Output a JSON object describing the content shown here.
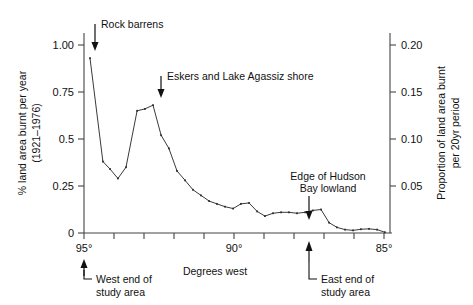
{
  "chart_data": {
    "type": "line",
    "title": "",
    "xlabel": "Degrees west",
    "ylabel": "% land area burnt per year (1921–1976)",
    "y2label": "Proportion of land area burnt per 20yr period",
    "xlim": [
      95,
      84.8
    ],
    "ylim": [
      0,
      1.05
    ],
    "y2lim": [
      0,
      0.21
    ],
    "grid": false,
    "legend": "none",
    "x_axis_direction": "decreasing degrees west (left to right)",
    "xticks": [
      95,
      90,
      85
    ],
    "xticklabels": [
      "95°",
      "90°",
      "85°"
    ],
    "xminorticks": [
      94,
      93,
      92,
      91,
      89,
      88,
      87,
      86
    ],
    "yticks": [
      0,
      0.25,
      0.5,
      0.75,
      1.0
    ],
    "yticklabels": [
      "0",
      "0.25",
      "0.5",
      "0.75",
      "1.00"
    ],
    "y2ticks": [
      0.05,
      0.1,
      0.15,
      0.2
    ],
    "y2ticklabels": [
      "0.05",
      "0.10",
      "0.15",
      "0.20"
    ],
    "y2_conversion": "proportion = percent_per_year * 0.2",
    "series": [
      {
        "name": "% land area burnt per year",
        "x": [
          94.8,
          94.37,
          94.13,
          93.87,
          93.6,
          93.23,
          92.97,
          92.7,
          92.43,
          92.17,
          91.9,
          91.63,
          91.37,
          91.1,
          90.83,
          90.57,
          90.3,
          90.03,
          89.77,
          89.5,
          89.23,
          88.97,
          88.7,
          88.43,
          88.17,
          87.9,
          87.63,
          87.37,
          87.1,
          86.83,
          86.57,
          86.3,
          86.03,
          85.77,
          85.5,
          85.23,
          84.97
        ],
        "y": [
          0.93,
          0.38,
          0.34,
          0.29,
          0.35,
          0.65,
          0.66,
          0.68,
          0.52,
          0.45,
          0.33,
          0.28,
          0.23,
          0.2,
          0.17,
          0.155,
          0.14,
          0.13,
          0.155,
          0.16,
          0.115,
          0.09,
          0.105,
          0.11,
          0.11,
          0.105,
          0.11,
          0.12,
          0.125,
          0.055,
          0.03,
          0.018,
          0.014,
          0.02,
          0.022,
          0.018,
          0.004
        ]
      }
    ],
    "annotations": [
      {
        "label": "Rock barrens",
        "x": 94.8,
        "y": 0.93,
        "name": "rock-barrens"
      },
      {
        "label": "Eskers and Lake Agassiz shore",
        "x": 92.7,
        "y": 0.68,
        "name": "eskers-lake-agassiz-shore"
      },
      {
        "label_line1": "Edge of Hudson",
        "label_line2": "Bay lowland",
        "x": 86.83,
        "y": 0.055,
        "name": "edge-of-hudson-bay-lowland"
      }
    ],
    "axis_markers": [
      {
        "label_line1": "West end of",
        "label_line2": "study area",
        "x": 95,
        "name": "west-end-of-study-area"
      },
      {
        "label_line1": "East end of",
        "label_line2": "study area",
        "x": 86.8,
        "name": "east-end-of-study-area"
      }
    ]
  },
  "axes": {
    "left_title_line1": "% land area burnt per year",
    "left_title_line2": "(1921–1976)",
    "right_title_line1": "Proportion of land area burnt",
    "right_title_line2": "per 20yr period",
    "x_title": "Degrees west",
    "ytick_1": "1.00",
    "ytick_2": "0.75",
    "ytick_3": "0.5",
    "ytick_4": "0.25",
    "ytick_5": "0",
    "y2tick_1": "0.20",
    "y2tick_2": "0.15",
    "y2tick_3": "0.10",
    "y2tick_4": "0.05",
    "xtick_1": "95°",
    "xtick_2": "90°",
    "xtick_3": "85°"
  },
  "annotations": {
    "a1": "Rock barrens",
    "a2": "Eskers and Lake Agassiz shore",
    "a3_line1": "Edge of Hudson",
    "a3_line2": "Bay lowland",
    "west_line1": "West end of",
    "west_line2": "study area",
    "east_line1": "East end of",
    "east_line2": "study area"
  },
  "colors": {
    "line": "#3a3a3a",
    "axis": "#444444",
    "text": "#111111",
    "background": "#ffffff"
  }
}
